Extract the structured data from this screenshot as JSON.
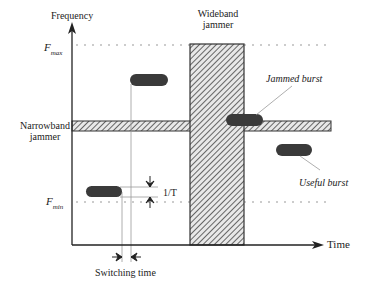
{
  "diagram": {
    "axes": {
      "y_label": "Frequency",
      "x_label": "Time",
      "f_max_main": "F",
      "f_max_sub": "max",
      "f_min_main": "F",
      "f_min_sub": "min"
    },
    "labels": {
      "wideband_line1": "Wideband",
      "wideband_line2": "jammer",
      "narrowband_line1": "Narrowband",
      "narrowband_line2": "jammer",
      "jammed_burst": "Jammed burst",
      "useful_burst": "Useful burst",
      "one_over_t": "1/T",
      "switching_time": "Switching time"
    },
    "colors": {
      "burst_fill": "#3a3a3a",
      "hatch": "#555555",
      "axis": "#222222",
      "dotted": "#999999"
    }
  }
}
